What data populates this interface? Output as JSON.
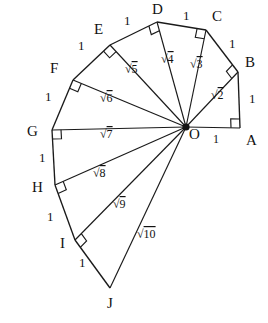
{
  "figure": {
    "center": {
      "name": "O",
      "label": "O",
      "x": 186,
      "y": 127
    },
    "stroke_color": "#1a1a1a",
    "background_color": "#ffffff"
  },
  "chart_data": {
    "type": "diagram",
    "vertices": [
      {
        "name": "A",
        "label": "A",
        "x": 240,
        "y": 128,
        "label_x": 246,
        "label_y": 145
      },
      {
        "name": "B",
        "label": "B",
        "x": 238,
        "y": 72,
        "label_x": 245,
        "label_y": 67
      },
      {
        "name": "C",
        "label": "C",
        "x": 206,
        "y": 30,
        "label_x": 212,
        "label_y": 21
      },
      {
        "name": "D",
        "label": "D",
        "x": 157,
        "y": 22,
        "label_x": 152,
        "label_y": 14
      },
      {
        "name": "E",
        "label": "E",
        "x": 110,
        "y": 45,
        "label_x": 94,
        "label_y": 34
      },
      {
        "name": "F",
        "label": "F",
        "x": 73,
        "y": 80,
        "label_x": 50,
        "label_y": 73
      },
      {
        "name": "G",
        "label": "G",
        "x": 52,
        "y": 130,
        "label_x": 27,
        "label_y": 136
      },
      {
        "name": "H",
        "label": "H",
        "x": 55,
        "y": 185,
        "label_x": 32,
        "label_y": 192
      },
      {
        "name": "I",
        "label": "I",
        "x": 75,
        "y": 240,
        "label_x": 60,
        "label_y": 248
      },
      {
        "name": "J",
        "label": "J",
        "x": 110,
        "y": 288,
        "label_x": 107,
        "label_y": 308
      }
    ],
    "radii": [
      {
        "name": "OA",
        "to": "A",
        "value": "1",
        "radical": false,
        "label": "1",
        "label_x": 213,
        "label_y": 143
      },
      {
        "name": "OB",
        "to": "B",
        "value": "2",
        "radical": true,
        "label": "2",
        "label_x": 211,
        "label_y": 99
      },
      {
        "name": "OC",
        "to": "C",
        "value": "3",
        "radical": true,
        "label": "3",
        "label_x": 190,
        "label_y": 68
      },
      {
        "name": "OD",
        "to": "D",
        "value": "4",
        "radical": true,
        "label": "4",
        "label_x": 161,
        "label_y": 63
      },
      {
        "name": "OE",
        "to": "E",
        "value": "5",
        "radical": true,
        "label": "5",
        "label_x": 125,
        "label_y": 73
      },
      {
        "name": "OF",
        "to": "F",
        "value": "6",
        "radical": true,
        "label": "6",
        "label_x": 100,
        "label_y": 102
      },
      {
        "name": "OG",
        "to": "G",
        "value": "7",
        "radical": true,
        "label": "7",
        "label_x": 100,
        "label_y": 138
      },
      {
        "name": "OH",
        "to": "H",
        "value": "8",
        "radical": true,
        "label": "8",
        "label_x": 93,
        "label_y": 177
      },
      {
        "name": "OI",
        "to": "I",
        "value": "9",
        "radical": true,
        "label": "9",
        "label_x": 113,
        "label_y": 208
      },
      {
        "name": "OJ",
        "to": "J",
        "value": "10",
        "radical": true,
        "label": "10",
        "label_x": 137,
        "label_y": 238
      }
    ],
    "unit_edges": [
      {
        "name": "AB",
        "from": "A",
        "to": "B",
        "label": "1",
        "label_x": 249,
        "label_y": 103
      },
      {
        "name": "BC",
        "from": "B",
        "to": "C",
        "label": "1",
        "label_x": 229,
        "label_y": 48
      },
      {
        "name": "CD",
        "from": "C",
        "to": "D",
        "label": "1",
        "label_x": 183,
        "label_y": 20
      },
      {
        "name": "DE",
        "from": "D",
        "to": "E",
        "label": "1",
        "label_x": 124,
        "label_y": 25
      },
      {
        "name": "EF",
        "from": "E",
        "to": "F",
        "label": "1",
        "label_x": 78,
        "label_y": 50
      },
      {
        "name": "FG",
        "from": "F",
        "to": "G",
        "label": "1",
        "label_x": 45,
        "label_y": 101
      },
      {
        "name": "GH",
        "from": "G",
        "to": "H",
        "label": "1",
        "label_x": 39,
        "label_y": 162
      },
      {
        "name": "HI",
        "from": "H",
        "to": "I",
        "label": "1",
        "label_x": 47,
        "label_y": 221
      },
      {
        "name": "IJ",
        "from": "I",
        "to": "J",
        "label": "1",
        "label_x": 79,
        "label_y": 267
      }
    ],
    "right_angles": [
      {
        "name": "right-angle-at-A",
        "at": "A"
      },
      {
        "name": "right-angle-at-B",
        "at": "B"
      },
      {
        "name": "right-angle-at-C",
        "at": "C"
      },
      {
        "name": "right-angle-at-D",
        "at": "D"
      },
      {
        "name": "right-angle-at-E",
        "at": "E"
      },
      {
        "name": "right-angle-at-F",
        "at": "F"
      },
      {
        "name": "right-angle-at-G",
        "at": "G"
      },
      {
        "name": "right-angle-at-H",
        "at": "H"
      },
      {
        "name": "right-angle-at-I",
        "at": "I"
      }
    ],
    "radical_sign": "√"
  }
}
